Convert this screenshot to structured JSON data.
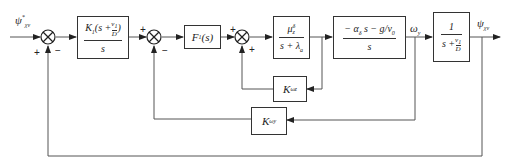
{
  "diagram": {
    "type": "block-diagram",
    "input_signal": "ψ*_χv",
    "output_signal": "ψ_χv",
    "intermediate_signal": "ω_y",
    "blocks": [
      {
        "id": "controller",
        "numerator": "K_1(s + v_1/D)",
        "denominator": "s"
      },
      {
        "id": "filter",
        "label": "F_1(s)"
      },
      {
        "id": "actuator",
        "numerator": "μ^δ_z",
        "denominator": "s + λ_a"
      },
      {
        "id": "dynamics",
        "numerator": "− α_δ s − g/v_0",
        "denominator": "s"
      },
      {
        "id": "kinematics",
        "numerator": "1",
        "denominator": "s + v_1/D"
      },
      {
        "id": "inner-gain",
        "label": "K_ωz"
      },
      {
        "id": "rate-gain",
        "label": "K_ωy"
      }
    ],
    "summing_junctions": [
      {
        "id": "sum1",
        "signs": [
          "+",
          "−"
        ]
      },
      {
        "id": "sum2",
        "signs": [
          "+",
          "−"
        ]
      },
      {
        "id": "sum3",
        "signs": [
          "+",
          "+"
        ]
      }
    ],
    "labels": {
      "input_main": "ψ",
      "input_sup": "*",
      "input_sub": "χv",
      "omega_main": "ω",
      "omega_sub": "y",
      "output_main": "ψ",
      "output_sub": "χv",
      "k_main": "K",
      "inner_sub": "ωz",
      "rate_sub": "ωy",
      "ctrl_num_a": "K",
      "ctrl_num_a_sub": "1",
      "ctrl_num_b": "(s +",
      "v_main": "v",
      "v_sub": "1",
      "D": "D",
      "close_paren": ")",
      "s": "s",
      "filter_main": "F",
      "filter_sub": "1",
      "filter_tail": "(s)",
      "act_num_main": "μ",
      "act_num_sup": "δ",
      "act_num_sub": "z",
      "act_den_main": "s + λ",
      "act_den_sub": "a",
      "dyn_num_a": "− α",
      "dyn_num_a_sub": "δ",
      "dyn_num_b": "s − g/v",
      "dyn_num_b_sub": "0",
      "one": "1",
      "kin_den_a": "s +",
      "plus": "+",
      "minus": "−"
    }
  }
}
